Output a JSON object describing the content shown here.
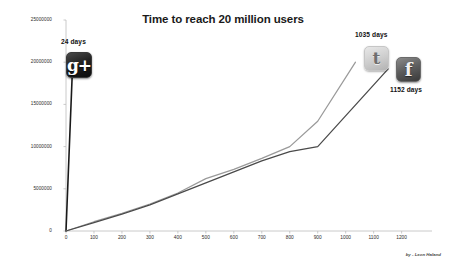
{
  "chart_data": {
    "type": "line",
    "title": "Time to reach 20 million users",
    "xlabel": "",
    "ylabel": "",
    "xlim": [
      0,
      1280
    ],
    "ylim": [
      0,
      25000000
    ],
    "grid": false,
    "legend": "none",
    "x_ticks": [
      "0",
      "100",
      "200",
      "300",
      "400",
      "500",
      "600",
      "700",
      "800",
      "900",
      "1000",
      "1100",
      "1200"
    ],
    "x_tick_values": [
      0,
      100,
      200,
      300,
      400,
      500,
      600,
      700,
      800,
      900,
      1000,
      1100,
      1200
    ],
    "y_ticks": [
      "0",
      "5000000",
      "10000000",
      "15000000",
      "20000000",
      "25000000"
    ],
    "y_tick_values": [
      0,
      5000000,
      10000000,
      15000000,
      20000000,
      25000000
    ],
    "series": [
      {
        "name": "Google+",
        "color": "#1a1a1a",
        "end_label": "24 days",
        "end_days": 24,
        "icon": "google-plus-icon",
        "x": [
          0,
          24
        ],
        "values": [
          0,
          20000000
        ]
      },
      {
        "name": "Twitter",
        "color": "#9a9a9a",
        "end_label": "1035 days",
        "end_days": 1035,
        "icon": "twitter-icon",
        "x": [
          0,
          100,
          200,
          300,
          400,
          500,
          600,
          700,
          800,
          900,
          1035
        ],
        "values": [
          0,
          1100000,
          2100000,
          3200000,
          4500000,
          6200000,
          7300000,
          8600000,
          10000000,
          13000000,
          20000000
        ]
      },
      {
        "name": "Facebook",
        "color": "#4a4a4a",
        "end_label": "1152 days",
        "end_days": 1152,
        "icon": "facebook-icon",
        "x": [
          0,
          100,
          200,
          300,
          400,
          500,
          600,
          700,
          800,
          900,
          1152
        ],
        "values": [
          0,
          1000000,
          2000000,
          3100000,
          4400000,
          5700000,
          7000000,
          8300000,
          9400000,
          10000000,
          19200000
        ]
      }
    ],
    "annotations": [
      {
        "text": "24 days",
        "series": "Google+"
      },
      {
        "text": "1035 days",
        "series": "Twitter"
      },
      {
        "text": "1152 days",
        "series": "Facebook"
      }
    ]
  },
  "icons": {
    "google_plus_glyph": "g+",
    "twitter_glyph": "t",
    "facebook_glyph": "f"
  },
  "credit": "by - Leon Håland"
}
